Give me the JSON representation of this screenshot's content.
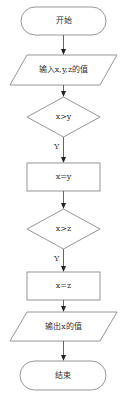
{
  "flowchart": {
    "start": {
      "label": "开始"
    },
    "input": {
      "label": "输入x,y,z的值"
    },
    "decision1": {
      "label": "x>y",
      "yes_label": "Y"
    },
    "assign1": {
      "label": "x=y"
    },
    "decision2": {
      "label": "x>z",
      "yes_label": "Y"
    },
    "assign2": {
      "label": "x=z"
    },
    "output": {
      "label": "输出x的值"
    },
    "end": {
      "label": "结束"
    }
  },
  "colors": {
    "stroke": "#8a8a8a",
    "arrow": "#222222",
    "text": "#333333"
  }
}
